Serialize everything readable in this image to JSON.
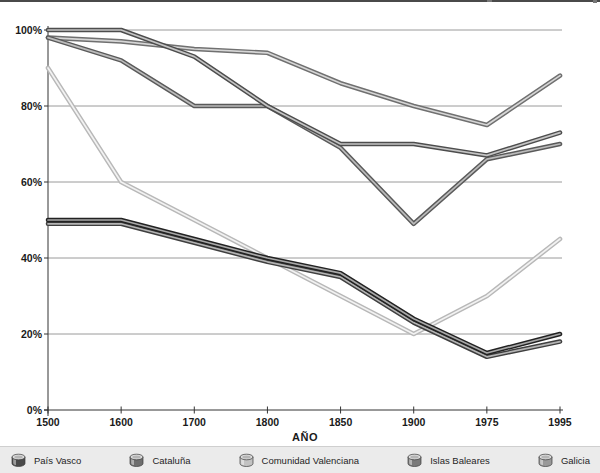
{
  "chart_data": {
    "type": "line",
    "title": "",
    "xlabel": "AÑO",
    "ylabel": "",
    "x_categories": [
      "1500",
      "1600",
      "1700",
      "1800",
      "1850",
      "1900",
      "1975",
      "1995"
    ],
    "y_tick_labels": [
      "100%",
      "80%",
      "60%",
      "40%",
      "20%",
      "0%"
    ],
    "y_tick_values": [
      100,
      80,
      60,
      40,
      20,
      0
    ],
    "ylim": [
      0,
      100
    ],
    "grid": "horizontal",
    "legend_position": "bottom",
    "line_style": "3d-tube-grayscale",
    "draw_order": [
      4,
      3,
      1,
      2,
      5,
      0
    ],
    "series": [
      {
        "name": "País Vasco",
        "values": [
          50,
          50,
          45,
          40,
          36,
          24,
          15,
          20
        ],
        "edge_color": "#222222",
        "core_color": "#a8a8a8",
        "legend_visible": true
      },
      {
        "name": "Cataluña",
        "values": [
          100,
          100,
          93,
          80,
          70,
          70,
          67,
          73
        ],
        "edge_color": "#4d4d4d",
        "core_color": "#c4c4c4",
        "legend_visible": true
      },
      {
        "name": "Comunidad Valenciana",
        "values": [
          90,
          60,
          50,
          40,
          30,
          20,
          30,
          45
        ],
        "edge_color": "#b8b8b8",
        "core_color": "#f2f2f2",
        "legend_visible": true
      },
      {
        "name": "Islas Baleares",
        "values": [
          98,
          92,
          80,
          80,
          69,
          49,
          66,
          70
        ],
        "edge_color": "#5a5a5a",
        "core_color": "#bbbbbb",
        "legend_visible": true
      },
      {
        "name": "Galicia",
        "values": [
          98,
          97,
          95,
          94,
          86,
          80,
          75,
          88
        ],
        "edge_color": "#707070",
        "core_color": "#d6d6d6",
        "legend_visible": true
      },
      {
        "name": "",
        "values": [
          49,
          49,
          44,
          39,
          35,
          23,
          14,
          18
        ],
        "edge_color": "#3f3f3f",
        "core_color": "#b4b4b4",
        "legend_visible": false,
        "note": "line visible in plot; its legend entry is cut off by the bottom edge of the screenshot"
      }
    ]
  },
  "legend": {
    "items": [
      {
        "label": "País Vasco",
        "icon": "cylinder-icon",
        "color": "#4a4a4a"
      },
      {
        "label": "Cataluña",
        "icon": "cylinder-icon",
        "color": "#6e6e6e"
      },
      {
        "label": "Comunidad Valenciana",
        "icon": "cylinder-icon",
        "color": "#c2c2c2"
      },
      {
        "label": "Islas Baleares",
        "icon": "cylinder-icon",
        "color": "#7a7a7a"
      },
      {
        "label": "Galicia",
        "icon": "cylinder-icon",
        "color": "#999999"
      }
    ]
  }
}
